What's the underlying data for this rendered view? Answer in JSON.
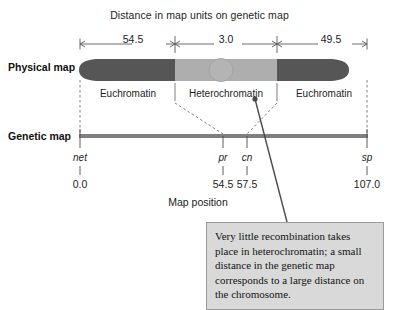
{
  "figure": {
    "title": "Distance in map units on genetic map",
    "axis_caption": "Map position"
  },
  "rows": {
    "physical_label": "Physical map",
    "genetic_label": "Genetic map"
  },
  "scale_bar": {
    "segments": [
      {
        "label": "54.5",
        "start_pos": 0.0,
        "end_pos": 54.5
      },
      {
        "label": "3.0",
        "start_pos": 54.5,
        "end_pos": 57.5
      },
      {
        "label": "49.5",
        "start_pos": 57.5,
        "end_pos": 107.0
      }
    ]
  },
  "chromosome": {
    "regions": [
      {
        "name": "Euchromatin",
        "label": "Euchromatin",
        "color": "#565656"
      },
      {
        "name": "Heterochromatin",
        "label": "Heterochromatin",
        "color": "#aeaeae"
      },
      {
        "name": "Euchromatin",
        "label": "Euchromatin",
        "color": "#565656"
      }
    ],
    "centromere_color": "#b4b4b4",
    "arm_color": "#565656"
  },
  "genetic_map": {
    "line_color": "#808080",
    "markers": [
      {
        "gene": "net",
        "position": "0.0"
      },
      {
        "gene": "pr",
        "position": "54.5"
      },
      {
        "gene": "cn",
        "position": "57.5"
      },
      {
        "gene": "sp",
        "position": "107.0"
      }
    ]
  },
  "callout": {
    "text": "Very little recombination takes place in heterochromatin; a small distance in the genetic map corresponds to a large distance on the chromosome.",
    "background": "#d9d9d9",
    "border": "#9a9a9a"
  }
}
